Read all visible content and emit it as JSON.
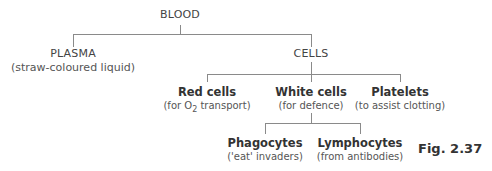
{
  "root": {
    "label": "BLOOD"
  },
  "level1": [
    {
      "label": "PLASMA",
      "sub": "(straw-coloured liquid)"
    },
    {
      "label": "CELLS"
    }
  ],
  "cells": [
    {
      "label": "Red cells",
      "sub_pre": "(for O",
      "sub_subscript": "2",
      "sub_post": " transport)"
    },
    {
      "label": "White cells",
      "sub": "(for defence)"
    },
    {
      "label": "Platelets",
      "sub": "(to assist clotting)"
    }
  ],
  "white_cells": [
    {
      "label": "Phagocytes",
      "sub": "('eat' invaders)"
    },
    {
      "label": "Lymphocytes",
      "sub": "(from antibodies)"
    }
  ],
  "figure_label": "Fig. 2.37"
}
